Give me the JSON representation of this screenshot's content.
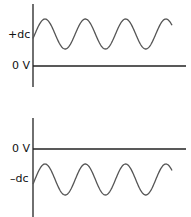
{
  "diagrams": [
    {
      "id": "positive-dc-offset",
      "labels": {
        "dc": "+dc",
        "zero": "0 V"
      },
      "waveform": "sine",
      "cycles": 4,
      "offset": "positive"
    },
    {
      "id": "negative-dc-offset",
      "labels": {
        "dc": "–dc",
        "zero": "0 V"
      },
      "waveform": "sine",
      "cycles": 4,
      "offset": "negative"
    }
  ],
  "colors": {
    "axis": "#222222",
    "wave": "#555555"
  }
}
